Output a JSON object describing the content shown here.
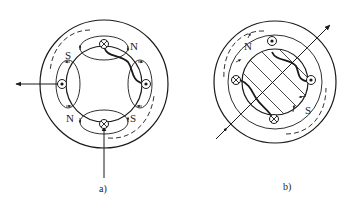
{
  "figure": {
    "panels": [
      {
        "id": "a",
        "caption": "a)",
        "pole_labels": [
          {
            "text": "S",
            "position": "upper-left"
          },
          {
            "text": "N",
            "position": "upper-right"
          },
          {
            "text": "N",
            "position": "lower-left"
          },
          {
            "text": "S",
            "position": "lower-right"
          }
        ],
        "conductors": [
          {
            "symbol": "cross",
            "position": "top"
          },
          {
            "symbol": "dot",
            "position": "right"
          },
          {
            "symbol": "cross",
            "position": "bottom"
          },
          {
            "symbol": "dot",
            "position": "left"
          }
        ],
        "arrows": [
          {
            "name": "axis-arrow-left",
            "direction": "left"
          },
          {
            "name": "axis-arrow-up",
            "direction": "up"
          }
        ]
      },
      {
        "id": "b",
        "caption": "b)",
        "pole_labels": [
          {
            "text": "N",
            "position": "upper-left"
          },
          {
            "text": "S",
            "position": "lower-right"
          }
        ],
        "conductors": [
          {
            "symbol": "dot",
            "position": "top"
          },
          {
            "symbol": "dot",
            "position": "right"
          },
          {
            "symbol": "cross",
            "position": "bottom"
          },
          {
            "symbol": "cross",
            "position": "left"
          }
        ],
        "arrows": [
          {
            "name": "diagonal-axis-arrow",
            "direction": "upper-right"
          }
        ]
      }
    ],
    "colors": {
      "stroke": "#1a1a1a",
      "background": "#ffffff"
    }
  }
}
